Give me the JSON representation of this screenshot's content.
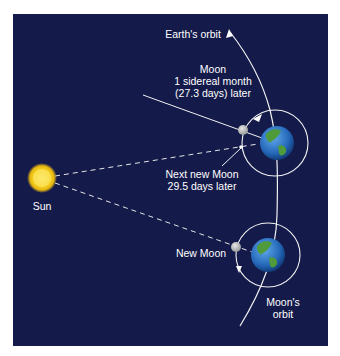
{
  "colors": {
    "background": "#141a4a",
    "line": "#f2f2f2",
    "sun": "#f5d21e",
    "moon": "#bfbfbf",
    "earth_ocean": "#2a6fc4",
    "earth_land": "#4f9a3a"
  },
  "labels": {
    "earths_orbit": "Earth's orbit",
    "moon_sidereal_line1": "Moon",
    "moon_sidereal_line2": "1 sidereal month",
    "moon_sidereal_line3": "(27.3 days) later",
    "next_new_moon_line1": "Next new Moon",
    "next_new_moon_line2": "29.5 days later",
    "sun": "Sun",
    "new_moon": "New Moon",
    "moons_orbit_line1": "Moon's",
    "moons_orbit_line2": "orbit"
  },
  "icons": {
    "sun": "sun-icon",
    "earth": "earth-icon",
    "moon": "moon-icon"
  }
}
